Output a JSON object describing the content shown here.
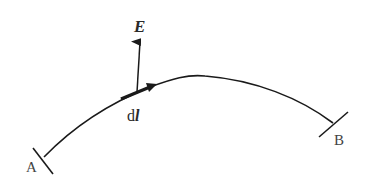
{
  "diagram": {
    "title": "",
    "labels": {
      "field_vector": "E",
      "line_element_prefix": "d",
      "line_element_symbol": "l",
      "start_point": "A",
      "end_point": "B"
    },
    "colors": {
      "stroke": "#1a1a1a",
      "text": "#2a2a2a",
      "background": "#ffffff"
    },
    "elements": [
      {
        "type": "curve",
        "from": "A",
        "to": "B",
        "description": "path from A to B"
      },
      {
        "type": "vector",
        "name": "E",
        "description": "electric field vector, pointing up"
      },
      {
        "type": "vector",
        "name": "dl",
        "description": "line element tangent to path"
      }
    ]
  }
}
